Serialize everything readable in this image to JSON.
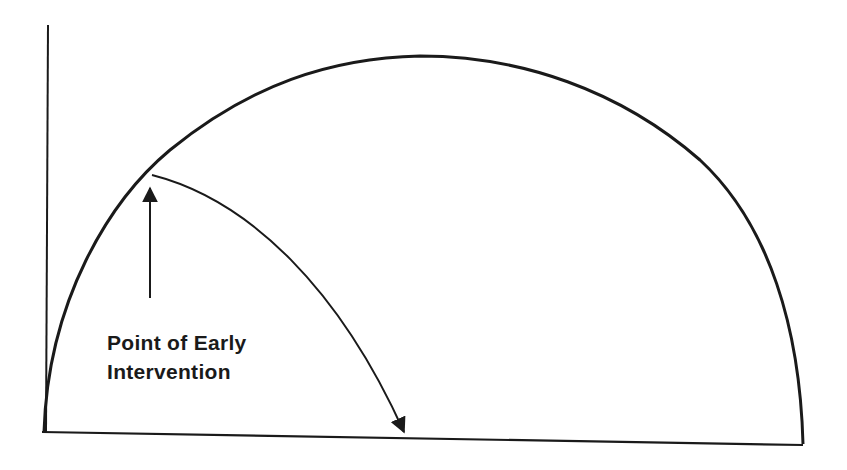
{
  "diagram": {
    "type": "semicircular-curve-with-intervention",
    "annotation": {
      "line1": "Point of Early",
      "line2": "Intervention"
    },
    "elements": [
      {
        "name": "y-axis",
        "kind": "line"
      },
      {
        "name": "x-axis",
        "kind": "line"
      },
      {
        "name": "main-arc",
        "kind": "semicircle"
      },
      {
        "name": "intervention-curve",
        "kind": "arrowed-curve"
      },
      {
        "name": "pointer-arrow",
        "kind": "arrow-up"
      }
    ],
    "colors": {
      "stroke": "#1a1a1a",
      "background": "#ffffff"
    }
  }
}
